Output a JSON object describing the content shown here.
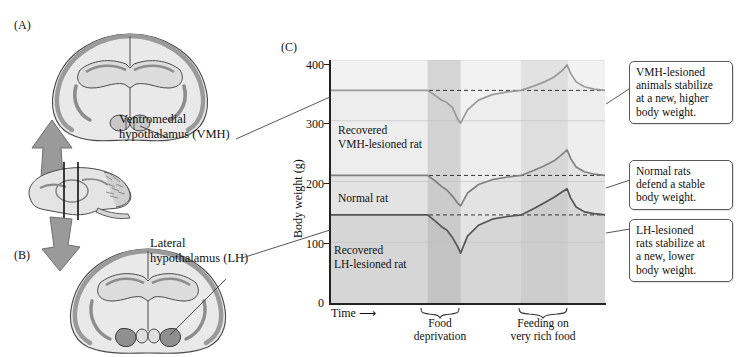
{
  "panels": {
    "a_letter": "(A)",
    "b_letter": "(B)",
    "c_letter": "(C)"
  },
  "anatomy": {
    "vmh_label_line1": "Ventromedial",
    "vmh_label_line2": "hypothalamus (VMH)",
    "lh_label_line1": "Lateral",
    "lh_label_line2": "hypothalamus (LH)",
    "coronal_section_a": "coronal-brain-section-vmh",
    "coronal_section_b": "coronal-brain-section-lh",
    "sagittal_section": "sagittal-brain-section",
    "arrow_up": "arrow-up-to-panel-a",
    "arrow_down": "arrow-down-to-panel-b"
  },
  "callouts": [
    {
      "id": "vmh-callout",
      "lines": [
        "VMH-lesioned",
        "animals stabilize",
        "at a new, higher",
        "body weight."
      ]
    },
    {
      "id": "normal-callout",
      "lines": [
        "Normal rats",
        "defend a stable",
        "body weight."
      ]
    },
    {
      "id": "lh-callout",
      "lines": [
        "LH-lesioned",
        "rats stabilize at",
        "a new, lower",
        "body weight."
      ]
    }
  ],
  "chart_data": {
    "type": "line",
    "title": "",
    "xlabel": "Time",
    "ylabel": "Body weight (g)",
    "ylim": [
      0,
      400
    ],
    "yticks": [
      0,
      100,
      200,
      300,
      400
    ],
    "ytick_labels": [
      "0",
      "100",
      "200",
      "300",
      "400"
    ],
    "xticks": [],
    "grid": true,
    "legend": "inline-labels",
    "x_axis_arrow": true,
    "annotations": [
      {
        "text_line1": "Recovered",
        "text_line2": "VMH-lesioned rat",
        "series": "VMH-lesioned"
      },
      {
        "text_line1": "Normal rat",
        "text_line2": "",
        "series": "Normal"
      },
      {
        "text_line1": "Recovered",
        "text_line2": "LH-lesioned rat",
        "series": "LH-lesioned"
      }
    ],
    "phases": [
      {
        "name": "Food deprivation",
        "label_line1": "Food",
        "label_line2": "deprivation",
        "x_start": 0.355,
        "x_end": 0.475,
        "shade": "#9e9e9e"
      },
      {
        "name": "Feeding on very rich food",
        "label_line1": "Feeding on",
        "label_line2": "very rich food",
        "x_start": 0.695,
        "x_end": 0.865,
        "shade": "#b5b5b5"
      }
    ],
    "baselines": [
      {
        "series": "VMH-lesioned",
        "value": 350
      },
      {
        "series": "Normal",
        "value": 210
      },
      {
        "series": "LH-lesioned",
        "value": 145
      }
    ],
    "series": [
      {
        "name": "VMH-lesioned",
        "baseline": 350,
        "min_during_deprivation": 296,
        "peak_during_rich_food": 392,
        "color": "#9a9a9a",
        "x": [
          0.0,
          0.1,
          0.2,
          0.3,
          0.355,
          0.385,
          0.405,
          0.425,
          0.445,
          0.465,
          0.475,
          0.5,
          0.54,
          0.59,
          0.64,
          0.695,
          0.74,
          0.78,
          0.815,
          0.845,
          0.862,
          0.875,
          0.895,
          0.925,
          0.96,
          1.0
        ],
        "values": [
          350,
          350,
          350,
          350,
          350,
          341,
          334,
          330,
          322,
          302,
          296,
          318,
          334,
          343,
          347,
          350,
          357,
          364,
          372,
          383,
          392,
          378,
          364,
          356,
          352,
          350
        ]
      },
      {
        "name": "Normal",
        "baseline": 210,
        "min_during_deprivation": 160,
        "peak_during_rich_food": 252,
        "color": "#808080",
        "x": [
          0.0,
          0.1,
          0.2,
          0.3,
          0.355,
          0.385,
          0.405,
          0.425,
          0.445,
          0.465,
          0.475,
          0.5,
          0.54,
          0.59,
          0.64,
          0.695,
          0.74,
          0.78,
          0.815,
          0.845,
          0.862,
          0.875,
          0.895,
          0.925,
          0.96,
          1.0
        ],
        "values": [
          210,
          210,
          210,
          210,
          210,
          200,
          192,
          186,
          176,
          164,
          160,
          181,
          195,
          203,
          207,
          210,
          218,
          226,
          234,
          245,
          252,
          238,
          224,
          216,
          212,
          210
        ]
      },
      {
        "name": "LH-lesioned",
        "baseline": 145,
        "min_during_deprivation": 82,
        "peak_during_rich_food": 188,
        "color": "#555555",
        "x": [
          0.0,
          0.1,
          0.2,
          0.3,
          0.355,
          0.385,
          0.405,
          0.425,
          0.445,
          0.465,
          0.475,
          0.5,
          0.54,
          0.59,
          0.64,
          0.695,
          0.74,
          0.78,
          0.815,
          0.845,
          0.862,
          0.875,
          0.895,
          0.925,
          0.96,
          1.0
        ],
        "values": [
          145,
          145,
          145,
          145,
          145,
          134,
          126,
          120,
          108,
          92,
          82,
          110,
          128,
          138,
          142,
          145,
          155,
          165,
          174,
          183,
          188,
          173,
          158,
          150,
          147,
          145
        ]
      }
    ]
  }
}
